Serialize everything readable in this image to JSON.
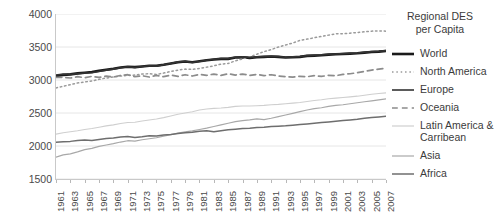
{
  "chart_data": {
    "type": "line",
    "title": "",
    "xlabel": "",
    "ylabel": "",
    "ylim": [
      1500,
      4000
    ],
    "ytick_values": [
      1500,
      2000,
      2500,
      3000,
      3500,
      4000
    ],
    "ytick_labels": [
      "1500",
      "2000",
      "2500",
      "3000",
      "3500",
      "4000"
    ],
    "grid": true,
    "grid_axis": "y",
    "legend_position": "right",
    "legend_title": "Regional DES\nper Capita",
    "x": [
      1961,
      1962,
      1963,
      1964,
      1965,
      1966,
      1967,
      1968,
      1969,
      1970,
      1971,
      1972,
      1973,
      1974,
      1975,
      1976,
      1977,
      1978,
      1979,
      1980,
      1981,
      1982,
      1983,
      1984,
      1985,
      1986,
      1987,
      1988,
      1989,
      1990,
      1991,
      1992,
      1993,
      1994,
      1995,
      1996,
      1997,
      1998,
      1999,
      2000,
      2001,
      2002,
      2003,
      2004,
      2005,
      2006,
      2007
    ],
    "xtick_labels": [
      "1961",
      "1963",
      "1965",
      "1967",
      "1969",
      "1971",
      "1973",
      "1975",
      "1977",
      "1979",
      "1981",
      "1983",
      "1985",
      "1987",
      "1989",
      "1991",
      "1993",
      "1995",
      "1997",
      "1999",
      "2001",
      "2003",
      "2005",
      "2007"
    ],
    "series": [
      {
        "name": "World",
        "style": "solid",
        "width": 2.6,
        "color": "#1a1a1a",
        "values": [
          3060,
          3075,
          3085,
          3100,
          3110,
          3120,
          3140,
          3155,
          3170,
          3190,
          3200,
          3195,
          3205,
          3215,
          3215,
          3230,
          3250,
          3270,
          3280,
          3270,
          3285,
          3300,
          3310,
          3320,
          3320,
          3340,
          3345,
          3335,
          3345,
          3350,
          3355,
          3350,
          3340,
          3345,
          3350,
          3365,
          3370,
          3375,
          3385,
          3390,
          3395,
          3400,
          3405,
          3415,
          3425,
          3430,
          3440
        ]
      },
      {
        "name": "North America",
        "style": "dotted",
        "width": 1.5,
        "color": "#9a9a9a",
        "values": [
          2880,
          2905,
          2930,
          2955,
          2970,
          2985,
          3010,
          3030,
          3045,
          3060,
          3070,
          3075,
          3090,
          3095,
          3085,
          3105,
          3130,
          3150,
          3165,
          3160,
          3175,
          3195,
          3215,
          3240,
          3250,
          3290,
          3320,
          3350,
          3390,
          3430,
          3460,
          3500,
          3530,
          3560,
          3600,
          3620,
          3640,
          3660,
          3680,
          3700,
          3700,
          3710,
          3720,
          3730,
          3740,
          3745,
          3740
        ]
      },
      {
        "name": "Europe",
        "style": "solid",
        "width": 1.6,
        "color": "#333333",
        "values": [
          3075,
          3090,
          3085,
          3095,
          3105,
          3110,
          3130,
          3150,
          3165,
          3185,
          3200,
          3190,
          3205,
          3215,
          3210,
          3230,
          3250,
          3275,
          3285,
          3265,
          3280,
          3300,
          3315,
          3325,
          3325,
          3345,
          3350,
          3340,
          3350,
          3355,
          3360,
          3355,
          3345,
          3350,
          3355,
          3370,
          3375,
          3380,
          3390,
          3395,
          3400,
          3405,
          3410,
          3420,
          3430,
          3435,
          3445
        ]
      },
      {
        "name": "Oceania",
        "style": "dashed",
        "width": 1.7,
        "color": "#8c8c8c",
        "values": [
          3040,
          3040,
          3030,
          3050,
          3035,
          3055,
          3040,
          3060,
          3045,
          3070,
          3080,
          3050,
          3065,
          3045,
          3070,
          3050,
          3075,
          3055,
          3080,
          3060,
          3085,
          3070,
          3090,
          3070,
          3095,
          3075,
          3090,
          3070,
          3085,
          3065,
          3080,
          3060,
          3050,
          3045,
          3055,
          3050,
          3065,
          3055,
          3070,
          3065,
          3085,
          3095,
          3110,
          3130,
          3150,
          3165,
          3180
        ]
      },
      {
        "name": "Latin America & Carribean",
        "style": "solid",
        "width": 1.1,
        "color": "#cfcfcf",
        "values": [
          2180,
          2200,
          2215,
          2230,
          2250,
          2265,
          2285,
          2305,
          2320,
          2340,
          2355,
          2360,
          2380,
          2395,
          2410,
          2430,
          2455,
          2480,
          2500,
          2520,
          2545,
          2560,
          2570,
          2575,
          2585,
          2600,
          2605,
          2605,
          2610,
          2615,
          2625,
          2630,
          2640,
          2650,
          2660,
          2675,
          2690,
          2700,
          2715,
          2725,
          2735,
          2745,
          2755,
          2770,
          2785,
          2795,
          2805
        ]
      },
      {
        "name": "Asia",
        "style": "solid",
        "width": 1.2,
        "color": "#a8a8a8",
        "values": [
          1830,
          1865,
          1880,
          1910,
          1945,
          1965,
          1995,
          2015,
          2035,
          2060,
          2080,
          2075,
          2095,
          2110,
          2125,
          2150,
          2170,
          2195,
          2215,
          2230,
          2250,
          2270,
          2295,
          2320,
          2345,
          2370,
          2385,
          2395,
          2410,
          2400,
          2420,
          2445,
          2470,
          2495,
          2520,
          2545,
          2565,
          2580,
          2600,
          2615,
          2625,
          2640,
          2655,
          2670,
          2685,
          2700,
          2715
        ]
      },
      {
        "name": "Africa",
        "style": "solid",
        "width": 1.5,
        "color": "#6e6e6e",
        "values": [
          2055,
          2065,
          2070,
          2085,
          2090,
          2085,
          2100,
          2115,
          2120,
          2135,
          2145,
          2130,
          2140,
          2155,
          2150,
          2165,
          2175,
          2190,
          2200,
          2210,
          2225,
          2230,
          2215,
          2230,
          2245,
          2255,
          2265,
          2270,
          2280,
          2285,
          2295,
          2300,
          2305,
          2315,
          2325,
          2335,
          2345,
          2355,
          2365,
          2375,
          2385,
          2395,
          2405,
          2420,
          2430,
          2440,
          2450
        ]
      }
    ]
  },
  "legend": {
    "title_line1": "Regional DES",
    "title_line2": "per Capita",
    "items": [
      {
        "label": "World"
      },
      {
        "label": "North America"
      },
      {
        "label": "Europe"
      },
      {
        "label": "Oceania"
      },
      {
        "label": "Latin America &"
      },
      {
        "label": "Carribean"
      },
      {
        "label": "Asia"
      },
      {
        "label": "Africa"
      }
    ]
  }
}
